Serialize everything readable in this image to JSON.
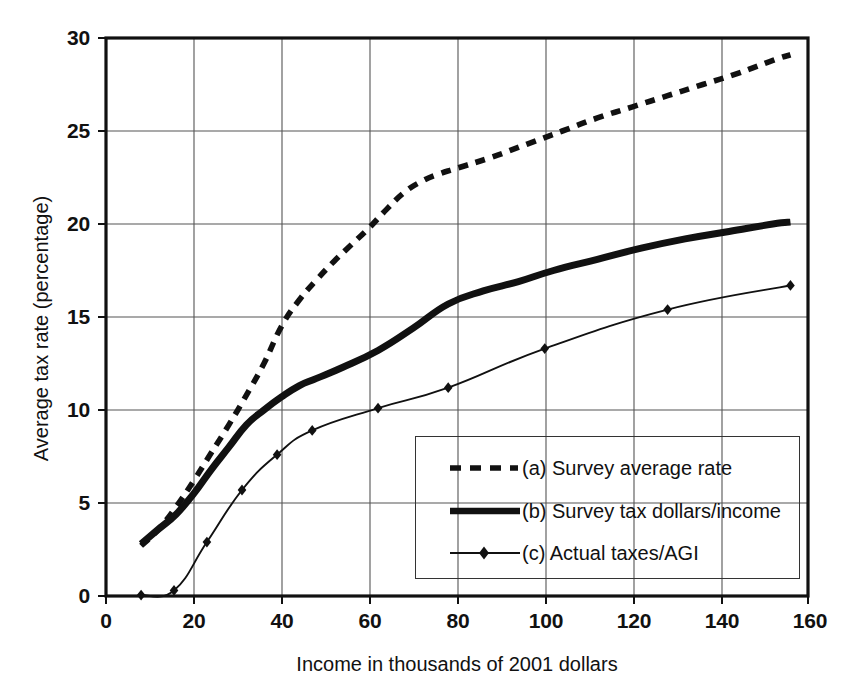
{
  "chart_data": {
    "type": "line",
    "title": "",
    "xlabel": "Income in thousands of 2001 dollars",
    "ylabel": "Average tax rate (percentage)",
    "xlim": [
      0,
      160
    ],
    "ylim": [
      0,
      30
    ],
    "xticks": [
      "0",
      "20",
      "40",
      "60",
      "80",
      "100",
      "120",
      "140",
      "160"
    ],
    "yticks": [
      "0",
      "5",
      "10",
      "15",
      "20",
      "25",
      "30"
    ],
    "grid": true,
    "legend_position": "lower right",
    "series": [
      {
        "name": "(a) Survey average rate",
        "key": "a",
        "style": "dashed",
        "marker": "none",
        "color": "#111111",
        "x": [
          8,
          12,
          16,
          20,
          24,
          28,
          32,
          36,
          40,
          44,
          48,
          52,
          56,
          60,
          64,
          68,
          72,
          76,
          80,
          88,
          96,
          104,
          112,
          120,
          128,
          136,
          144,
          152,
          156
        ],
        "y": [
          2.7,
          3.6,
          4.8,
          6.2,
          7.7,
          9.2,
          10.8,
          12.5,
          14.5,
          15.9,
          17.0,
          18.0,
          18.9,
          19.8,
          20.8,
          21.7,
          22.3,
          22.7,
          23.0,
          23.6,
          24.3,
          25.0,
          25.7,
          26.3,
          26.9,
          27.5,
          28.1,
          28.8,
          29.1
        ]
      },
      {
        "name": "(b) Survey tax dollars/income",
        "key": "b",
        "style": "solid-thick",
        "marker": "none",
        "color": "#111111",
        "x": [
          8,
          12,
          16,
          20,
          24,
          28,
          32,
          36,
          40,
          44,
          48,
          54,
          62,
          70,
          78,
          86,
          94,
          102,
          112,
          122,
          132,
          142,
          152,
          156
        ],
        "y": [
          2.8,
          3.6,
          4.4,
          5.5,
          6.8,
          8.0,
          9.2,
          10.0,
          10.7,
          11.3,
          11.7,
          12.3,
          13.2,
          14.4,
          15.7,
          16.4,
          16.9,
          17.5,
          18.1,
          18.7,
          19.2,
          19.6,
          20.0,
          20.1
        ]
      },
      {
        "name": "(c) Actual taxes/AGI",
        "key": "c",
        "style": "solid-thin",
        "marker": "diamond",
        "color": "#111111",
        "x": [
          8,
          15.5,
          23,
          31,
          39,
          47,
          62,
          78,
          100,
          128,
          156
        ],
        "y": [
          0.05,
          0.3,
          2.9,
          5.7,
          7.6,
          8.9,
          10.1,
          11.2,
          13.3,
          15.4,
          16.7
        ]
      }
    ]
  },
  "legend": {
    "items": [
      {
        "label": "(a) Survey average rate"
      },
      {
        "label": "(b) Survey tax dollars/income"
      },
      {
        "label": "(c) Actual taxes/AGI"
      }
    ]
  }
}
